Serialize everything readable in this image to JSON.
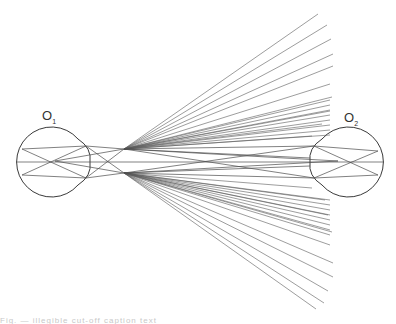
{
  "diagram": {
    "title": "",
    "labels": {
      "left_eye": {
        "main": "O",
        "sub": "1"
      },
      "right_eye": {
        "main": "O",
        "sub": "2"
      }
    },
    "colors": {
      "line": "#4a4a4a",
      "background": "#ffffff"
    },
    "left_eye": {
      "cx": 51,
      "cy": 162,
      "r": 35,
      "cornea_x": 90,
      "retina_points": [
        [
          22,
          149
        ],
        [
          22,
          175
        ]
      ],
      "nodal_point": [
        55,
        161
      ],
      "cornea_points": [
        [
          86,
          146
        ],
        [
          86,
          178
        ]
      ]
    },
    "right_eye": {
      "cx": 350,
      "cy": 162,
      "r": 35,
      "cornea_x": 310,
      "retina_points": [
        [
          378,
          151
        ],
        [
          378,
          175
        ]
      ],
      "nodal_point": [
        338,
        161
      ],
      "cornea_points": [
        [
          314,
          146
        ],
        [
          314,
          178
        ]
      ]
    },
    "focal_points": {
      "upper": [
        124,
        149
      ],
      "lower": [
        124,
        173
      ]
    },
    "fan_upper_endpoints": [
      [
        318,
        14
      ],
      [
        327,
        25
      ],
      [
        331,
        39
      ],
      [
        333,
        54
      ],
      [
        333,
        66
      ],
      [
        330,
        84
      ],
      [
        332,
        97
      ],
      [
        330,
        111
      ],
      [
        322,
        124
      ],
      [
        312,
        136
      ]
    ],
    "fan_lower_endpoints": [
      [
        312,
        188
      ],
      [
        325,
        200
      ],
      [
        328,
        215
      ],
      [
        332,
        232
      ],
      [
        330,
        245
      ],
      [
        333,
        263
      ],
      [
        333,
        277
      ],
      [
        328,
        291
      ],
      [
        324,
        303
      ],
      [
        316,
        309
      ]
    ]
  },
  "caption": {
    "text": "Fig. — illegible cut-off caption text"
  }
}
